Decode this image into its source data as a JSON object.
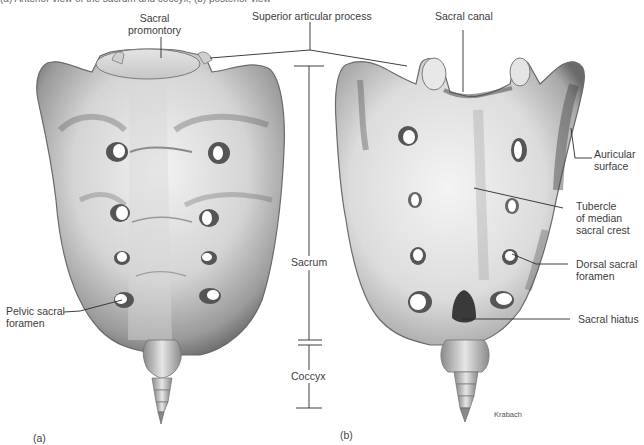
{
  "figure": {
    "caption": "(a) Anterior view of the sacrum and coccyx; (b) posterior view",
    "panels": [
      {
        "id": "a",
        "label": "(a)",
        "view": "anterior"
      },
      {
        "id": "b",
        "label": "(b)",
        "view": "posterior"
      }
    ],
    "credit": "Krabach"
  },
  "labels": {
    "sacral_promontory_1": "Sacral",
    "sacral_promontory_2": "promontory",
    "superior_articular_process": "Superior articular process",
    "sacral_canal": "Sacral canal",
    "auricular_surface_1": "Auricular",
    "auricular_surface_2": "surface",
    "tubercle_1": "Tubercle",
    "tubercle_2": "of median",
    "tubercle_3": "sacral crest",
    "dorsal_foramen_1": "Dorsal sacral",
    "dorsal_foramen_2": "foramen",
    "sacral_hiatus": "Sacral hiatus",
    "pelvic_foramen_1": "Pelvic sacral",
    "pelvic_foramen_2": "foramen",
    "sacrum": "Sacrum",
    "coccyx": "Coccyx"
  },
  "colors": {
    "bone_light": "#efefef",
    "bone_mid": "#bdbdbd",
    "bone_dark": "#6e6e6e",
    "leader_line": "#2a2a2a",
    "background": "#ffffff"
  }
}
